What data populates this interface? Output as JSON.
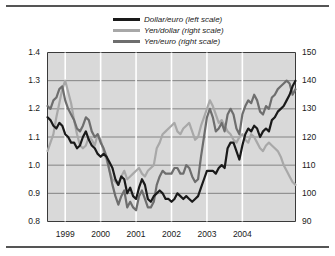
{
  "chart_data": {
    "type": "line",
    "title": "",
    "subtitle": "",
    "xlabel": "",
    "ylabel": "",
    "y2label": "",
    "grid": true,
    "legend_position": "top-center",
    "plot_background": "#d9d9d9",
    "x_tick_labels": [
      "1999",
      "2000",
      "2001",
      "2002",
      "2003",
      "2004"
    ],
    "x_range_note": "mid-1998 to late-2004, monthly observations",
    "left_axis": {
      "ticks": [
        "0.8",
        "0.9",
        "1.0",
        "1.1",
        "1.2",
        "1.3",
        "1.4"
      ],
      "min": 0.8,
      "max": 1.4,
      "step": 0.1
    },
    "right_axis": {
      "ticks": [
        "90",
        "100",
        "110",
        "120",
        "130",
        "140",
        "150"
      ],
      "min": 90,
      "max": 150,
      "step": 10
    },
    "series": [
      {
        "name": "Dollar/euro (left scale)",
        "axis": "left",
        "color": "#1a1a1a",
        "width": 2.2,
        "values": [
          1.17,
          1.16,
          1.14,
          1.13,
          1.15,
          1.14,
          1.11,
          1.1,
          1.08,
          1.08,
          1.06,
          1.07,
          1.1,
          1.12,
          1.09,
          1.07,
          1.06,
          1.04,
          1.03,
          1.04,
          1.03,
          1.01,
          0.99,
          0.95,
          0.93,
          0.96,
          0.95,
          0.9,
          0.92,
          0.89,
          0.88,
          0.92,
          0.95,
          0.93,
          0.88,
          0.87,
          0.89,
          0.9,
          0.91,
          0.9,
          0.88,
          0.88,
          0.87,
          0.88,
          0.9,
          0.89,
          0.88,
          0.89,
          0.88,
          0.87,
          0.88,
          0.89,
          0.92,
          0.95,
          0.98,
          0.98,
          0.98,
          0.97,
          0.99,
          1.0,
          0.99,
          1.06,
          1.08,
          1.08,
          1.05,
          1.02,
          1.07,
          1.11,
          1.13,
          1.12,
          1.14,
          1.13,
          1.1,
          1.12,
          1.13,
          1.12,
          1.16,
          1.17,
          1.19,
          1.2,
          1.21,
          1.23,
          1.25,
          1.28,
          1.3
        ]
      },
      {
        "name": "Yen/dollar (right scale)",
        "axis": "right",
        "color": "#a8a8a8",
        "width": 2.2,
        "values": [
          115,
          118,
          121,
          127,
          132,
          137,
          140,
          136,
          132,
          126,
          121,
          117,
          116,
          117,
          120,
          119,
          117,
          121,
          119,
          115,
          112,
          108,
          105,
          104,
          103,
          106,
          108,
          105,
          106,
          107,
          108,
          109,
          107,
          106,
          108,
          109,
          110,
          116,
          118,
          121,
          122,
          123,
          124,
          125,
          122,
          121,
          123,
          124,
          125,
          122,
          119,
          120,
          124,
          127,
          130,
          133,
          131,
          128,
          125,
          126,
          124,
          122,
          121,
          119,
          118,
          120,
          121,
          119,
          118,
          121,
          120,
          118,
          116,
          115,
          117,
          118,
          117,
          116,
          115,
          113,
          110,
          108,
          106,
          104,
          103
        ]
      },
      {
        "name": "Yen/euro (right scale)",
        "axis": "right",
        "color": "#6e6e6e",
        "width": 2.2,
        "values": [
          131,
          130,
          133,
          134,
          137,
          138,
          133,
          130,
          128,
          126,
          123,
          122,
          124,
          127,
          126,
          122,
          120,
          121,
          118,
          116,
          113,
          108,
          103,
          99,
          96,
          99,
          101,
          95,
          97,
          95,
          94,
          99,
          101,
          98,
          95,
          95,
          97,
          103,
          106,
          108,
          107,
          107,
          107,
          109,
          109,
          107,
          107,
          110,
          109,
          106,
          104,
          105,
          113,
          120,
          127,
          130,
          127,
          122,
          123,
          125,
          122,
          128,
          130,
          128,
          123,
          121,
          128,
          131,
          133,
          132,
          135,
          133,
          129,
          128,
          131,
          130,
          134,
          135,
          137,
          138,
          139,
          140,
          139,
          135,
          137
        ]
      }
    ]
  }
}
